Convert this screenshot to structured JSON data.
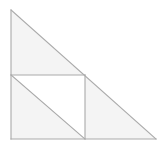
{
  "figure": {
    "canvas": {
      "width": 164,
      "height": 152,
      "background": "#ffffff"
    },
    "style": {
      "stroke_color": "#a9a9a9",
      "stroke_width": 1.1,
      "shaded_fill": "#f4f4f4",
      "unshaded_fill": "#ffffff"
    },
    "points": {
      "apex": {
        "name": "A",
        "x": 11,
        "y": 10
      },
      "bottom_left": {
        "name": "B",
        "x": 11,
        "y": 139
      },
      "bottom_right": {
        "name": "C",
        "x": 156,
        "y": 139
      },
      "square_top_left": {
        "name": "D",
        "x": 11,
        "y": 75
      },
      "square_top_right": {
        "name": "E",
        "x": 85,
        "y": 75
      },
      "square_bottom_right": {
        "name": "F",
        "x": 85,
        "y": 139
      }
    },
    "shapes": [
      {
        "id": "upper-triangle",
        "label": "upper shaded triangle",
        "polygon": "11,10 85,75 11,75",
        "fill": "#f4f4f4"
      },
      {
        "id": "right-triangle",
        "label": "right shaded triangle",
        "polygon": "85,75 156,139 85,139",
        "fill": "#f4f4f4"
      },
      {
        "id": "lower-left-triangle",
        "label": "lower-left shaded triangle inside square",
        "polygon": "11,75 85,139 11,139",
        "fill": "#f4f4f4"
      },
      {
        "id": "inner-white-triangle",
        "label": "upper-right white triangle inside square",
        "polygon": "11,75 85,75 85,139",
        "fill": "#ffffff"
      }
    ],
    "lines": [
      {
        "id": "vertical-leg",
        "label": "left vertical leg",
        "x1": 11,
        "y1": 10,
        "x2": 11,
        "y2": 139
      },
      {
        "id": "horizontal-leg",
        "label": "bottom horizontal leg",
        "x1": 11,
        "y1": 139,
        "x2": 156,
        "y2": 139
      },
      {
        "id": "hypotenuse",
        "label": "hypotenuse",
        "x1": 11,
        "y1": 10,
        "x2": 156,
        "y2": 139
      },
      {
        "id": "square-top-edge",
        "label": "inscribed square top edge",
        "x1": 11,
        "y1": 75,
        "x2": 85,
        "y2": 75
      },
      {
        "id": "square-right-edge",
        "label": "inscribed square right edge",
        "x1": 85,
        "y1": 75,
        "x2": 85,
        "y2": 139
      },
      {
        "id": "square-diagonal",
        "label": "inscribed square diagonal",
        "x1": 11,
        "y1": 75,
        "x2": 85,
        "y2": 139
      }
    ]
  }
}
